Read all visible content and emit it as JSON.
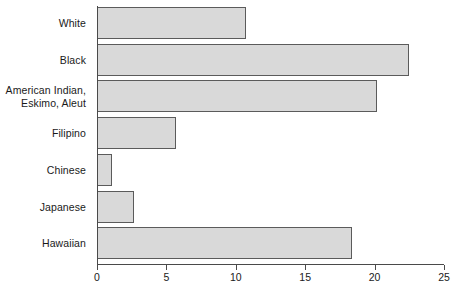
{
  "chart_data": {
    "type": "bar",
    "orientation": "horizontal",
    "title": "",
    "subtitle": "",
    "xlabel": "",
    "ylabel": "",
    "xlim": [
      0,
      25
    ],
    "xticks": [
      0,
      5,
      10,
      15,
      20,
      25
    ],
    "xtick_labels": [
      "0",
      "5",
      "10",
      "15",
      "20",
      "25"
    ],
    "grid": false,
    "legend": null,
    "categories": [
      "White",
      "Black",
      "American Indian,\nEskimo, Aleut",
      "Filipino",
      "Chinese",
      "Japanese",
      "Hawaiian"
    ],
    "values": [
      10.7,
      22.5,
      20.2,
      5.7,
      1.05,
      2.65,
      18.4
    ],
    "bar_fill_color": "#d9d9d9",
    "bar_border_color": "#5b5b5b",
    "axis_color": "#4a4a4a",
    "background_color": "#ffffff"
  },
  "bars": [
    {
      "label": "White",
      "value": 10.7
    },
    {
      "label": "Black",
      "value": 22.5
    },
    {
      "label": "American Indian,\nEskimo, Aleut",
      "value": 20.2
    },
    {
      "label": "Filipino",
      "value": 5.7
    },
    {
      "label": "Chinese",
      "value": 1.05
    },
    {
      "label": "Japanese",
      "value": 2.65
    },
    {
      "label": "Hawaiian",
      "value": 18.4
    }
  ],
  "axis": {
    "ticks": [
      {
        "label": "0",
        "value": 0
      },
      {
        "label": "5",
        "value": 5
      },
      {
        "label": "10",
        "value": 10
      },
      {
        "label": "15",
        "value": 15
      },
      {
        "label": "20",
        "value": 20
      },
      {
        "label": "25",
        "value": 25
      }
    ]
  }
}
